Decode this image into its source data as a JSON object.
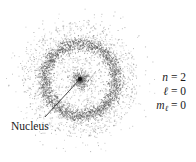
{
  "figure": {
    "labels": {
      "nucleus": "Nucleus"
    },
    "quantum_numbers": {
      "n": {
        "symbol": "n",
        "equals": " = ",
        "value": "2"
      },
      "l": {
        "symbol": "ℓ",
        "equals": " = ",
        "value": "0"
      },
      "ml": {
        "symbol": "m",
        "subscript": "ℓ",
        "equals": " = ",
        "value": "0"
      }
    },
    "geometry": {
      "center_x": 80,
      "center_y": 79,
      "ring_radius": 36,
      "ring_width": 8,
      "outer_radius": 58,
      "core_radius": 11,
      "leader_end_x": 45,
      "leader_end_y": 117
    },
    "colors": {
      "background": "#ffffff",
      "dots": "#555555",
      "text": "#1a1a1a"
    }
  }
}
